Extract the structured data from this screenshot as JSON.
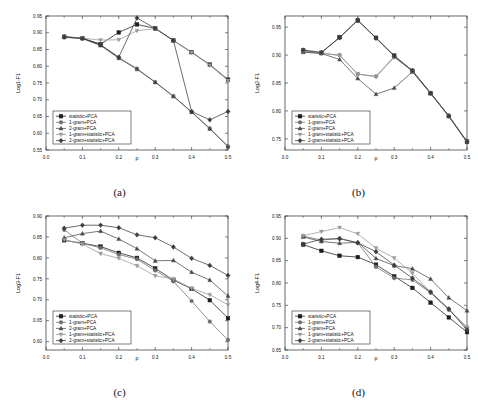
{
  "figure": {
    "panels": [
      {
        "caption": "(a)",
        "key": "a"
      },
      {
        "caption": "(b)",
        "key": "b"
      },
      {
        "caption": "(c)",
        "key": "c"
      },
      {
        "caption": "(d)",
        "key": "d"
      }
    ],
    "legend_labels": [
      "statistic+PCA",
      "1-gram+PCA",
      "2-gram+PCA",
      "1-gram+statistic+PCA",
      "2-gram+statistic+PCA"
    ],
    "marker_shapes": [
      "square",
      "circle",
      "triangle-up",
      "triangle-down",
      "diamond"
    ],
    "series_colors": [
      "#1d1d1d",
      "#6e6e6e",
      "#4a4a4a",
      "#9a9a9a",
      "#3c3c3c"
    ],
    "xlabel": "p",
    "xticks": [
      "0.0",
      "0.1",
      "0.2",
      "0.3",
      "0.4",
      "0.5"
    ],
    "xlim": [
      0.0,
      0.5
    ]
  },
  "chart_data": [
    {
      "type": "line",
      "panel": "(a)",
      "title": "",
      "xlabel": "p",
      "ylabel": "Log1-F1",
      "xlim": [
        0.0,
        0.5
      ],
      "ylim": [
        0.55,
        0.95
      ],
      "yticks": [
        0.55,
        0.6,
        0.65,
        0.7,
        0.75,
        0.8,
        0.85,
        0.9,
        0.95
      ],
      "xticks": [
        0.0,
        0.1,
        0.2,
        0.3,
        0.4,
        0.5
      ],
      "grid": false,
      "legend_position": "lower-left",
      "x": [
        0.05,
        0.1,
        0.15,
        0.2,
        0.25,
        0.3,
        0.35,
        0.4,
        0.45,
        0.5
      ],
      "series": [
        {
          "name": "statistic+PCA",
          "values": [
            0.888,
            0.884,
            0.866,
            0.901,
            0.925,
            0.913,
            0.877,
            0.842,
            0.805,
            0.76
          ]
        },
        {
          "name": "1-gram+PCA",
          "values": [
            0.886,
            0.883,
            0.864,
            0.826,
            0.793,
            0.753,
            0.711,
            0.664,
            0.615,
            0.561
          ]
        },
        {
          "name": "2-gram+PCA",
          "values": [
            0.887,
            0.883,
            0.862,
            0.824,
            0.791,
            0.752,
            0.71,
            0.663,
            0.613,
            0.56
          ]
        },
        {
          "name": "1-gram+statistic+PCA",
          "values": [
            0.889,
            0.884,
            0.878,
            0.879,
            0.906,
            0.912,
            0.876,
            0.841,
            0.803,
            0.757
          ]
        },
        {
          "name": "2-gram+statistic+PCA",
          "values": [
            0.888,
            0.883,
            0.864,
            0.827,
            0.944,
            0.913,
            0.877,
            0.665,
            0.64,
            0.665
          ]
        }
      ]
    },
    {
      "type": "line",
      "panel": "(b)",
      "title": "",
      "xlabel": "p",
      "ylabel": "Log2-F1",
      "xlim": [
        0.0,
        0.5
      ],
      "ylim": [
        0.73,
        0.97
      ],
      "yticks": [
        0.75,
        0.8,
        0.85,
        0.9,
        0.95
      ],
      "xticks": [
        0.0,
        0.1,
        0.2,
        0.3,
        0.4,
        0.5
      ],
      "grid": false,
      "legend_position": "lower-left",
      "x": [
        0.05,
        0.1,
        0.15,
        0.2,
        0.25,
        0.3,
        0.35,
        0.4,
        0.45,
        0.5
      ],
      "series": [
        {
          "name": "statistic+PCA",
          "values": [
            0.908,
            0.904,
            0.932,
            0.962,
            0.931,
            0.899,
            0.872,
            0.832,
            0.791,
            0.745
          ]
        },
        {
          "name": "1-gram+PCA",
          "values": [
            0.906,
            0.903,
            0.9,
            0.866,
            0.862,
            0.897,
            0.871,
            0.832,
            0.791,
            0.744
          ]
        },
        {
          "name": "2-gram+PCA",
          "values": [
            0.905,
            0.903,
            0.892,
            0.858,
            0.83,
            0.841,
            0.87,
            0.831,
            0.79,
            0.744
          ]
        },
        {
          "name": "1-gram+statistic+PCA",
          "values": [
            0.907,
            0.904,
            0.899,
            0.866,
            0.861,
            0.896,
            0.871,
            0.832,
            0.791,
            0.745
          ]
        },
        {
          "name": "2-gram+statistic+PCA",
          "values": [
            0.909,
            0.905,
            0.931,
            0.963,
            0.93,
            0.898,
            0.872,
            0.832,
            0.791,
            0.745
          ]
        }
      ]
    },
    {
      "type": "line",
      "panel": "(c)",
      "title": "",
      "xlabel": "p",
      "ylabel": "Log3-F1",
      "xlim": [
        0.0,
        0.5
      ],
      "ylim": [
        0.58,
        0.9
      ],
      "yticks": [
        0.6,
        0.65,
        0.7,
        0.75,
        0.8,
        0.85,
        0.9
      ],
      "xticks": [
        0.0,
        0.1,
        0.2,
        0.3,
        0.4,
        0.5
      ],
      "grid": false,
      "legend_position": "lower-left",
      "x": [
        0.05,
        0.1,
        0.15,
        0.2,
        0.25,
        0.3,
        0.35,
        0.4,
        0.45,
        0.5
      ],
      "series": [
        {
          "name": "statistic+PCA",
          "values": [
            0.842,
            0.835,
            0.827,
            0.812,
            0.8,
            0.775,
            0.747,
            0.726,
            0.699,
            0.656
          ]
        },
        {
          "name": "1-gram+PCA",
          "values": [
            0.867,
            0.835,
            0.824,
            0.808,
            0.797,
            0.77,
            0.744,
            0.697,
            0.648,
            0.604
          ]
        },
        {
          "name": "2-gram+PCA",
          "values": [
            0.848,
            0.858,
            0.864,
            0.845,
            0.822,
            0.793,
            0.794,
            0.766,
            0.747,
            0.709
          ]
        },
        {
          "name": "1-gram+statistic+PCA",
          "values": [
            0.843,
            0.833,
            0.81,
            0.799,
            0.781,
            0.757,
            0.75,
            0.727,
            0.712,
            0.688
          ]
        },
        {
          "name": "2-gram+statistic+PCA",
          "values": [
            0.871,
            0.878,
            0.878,
            0.872,
            0.855,
            0.848,
            0.826,
            0.799,
            0.782,
            0.758
          ]
        }
      ]
    },
    {
      "type": "line",
      "panel": "(d)",
      "title": "",
      "xlabel": "p",
      "ylabel": "Log4-F1",
      "xlim": [
        0.0,
        0.5
      ],
      "ylim": [
        0.65,
        0.95
      ],
      "yticks": [
        0.65,
        0.7,
        0.75,
        0.8,
        0.85,
        0.9,
        0.95
      ],
      "xticks": [
        0.0,
        0.1,
        0.2,
        0.3,
        0.4,
        0.5
      ],
      "grid": false,
      "legend_position": "lower-left",
      "x": [
        0.05,
        0.1,
        0.15,
        0.2,
        0.25,
        0.3,
        0.35,
        0.4,
        0.45,
        0.5
      ],
      "series": [
        {
          "name": "statistic+PCA",
          "values": [
            0.886,
            0.872,
            0.861,
            0.858,
            0.841,
            0.815,
            0.789,
            0.756,
            0.723,
            0.69
          ]
        },
        {
          "name": "1-gram+PCA",
          "values": [
            0.905,
            0.896,
            0.9,
            0.89,
            0.836,
            0.811,
            0.807,
            0.778,
            0.74,
            0.7
          ]
        },
        {
          "name": "2-gram+PCA",
          "values": [
            0.903,
            0.893,
            0.889,
            0.891,
            0.855,
            0.839,
            0.832,
            0.809,
            0.767,
            0.738
          ]
        },
        {
          "name": "1-gram+statistic+PCA",
          "values": [
            0.906,
            0.915,
            0.924,
            0.91,
            0.878,
            0.856,
            0.822,
            0.779,
            0.741,
            0.701
          ]
        },
        {
          "name": "2-gram+statistic+PCA",
          "values": [
            0.887,
            0.898,
            0.899,
            0.89,
            0.87,
            0.84,
            0.811,
            0.78,
            0.742,
            0.695
          ]
        }
      ]
    }
  ]
}
